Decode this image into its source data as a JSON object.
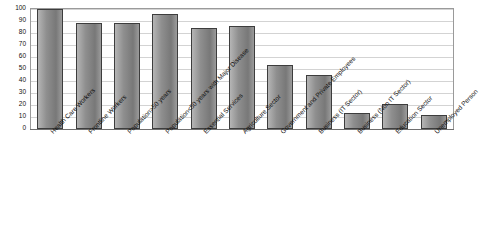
{
  "chart_data": {
    "type": "bar",
    "title": "",
    "xlabel": "",
    "ylabel": "",
    "ylim": [
      0,
      100
    ],
    "yticks": [
      0,
      10,
      20,
      30,
      40,
      50,
      60,
      70,
      80,
      90,
      100
    ],
    "grid": true,
    "legend": "none",
    "categories": [
      "Health Care Workers",
      "Frontline Workers",
      "Population>50 years",
      "Population<50 years with Major Disease",
      "Essential Services",
      "Agriculture Sector",
      "Government and Private Employees",
      "Business (IT Sector)",
      "Business (Non IT Sector)",
      "Education Sector",
      "Unemployed Person"
    ],
    "values": [
      100,
      88,
      88,
      96,
      84,
      86,
      53,
      45,
      13,
      21,
      12
    ],
    "bar_color": "#8c8c8c",
    "bar_border_color": "#3d3d3d"
  }
}
